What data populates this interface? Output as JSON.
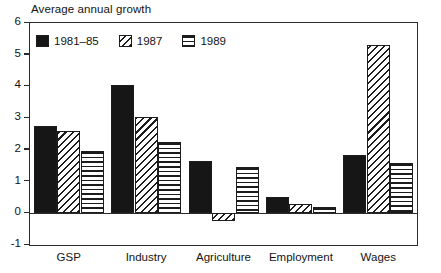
{
  "chart_data": {
    "type": "bar",
    "title": "Average annual growth",
    "xlabel": "",
    "ylabel": "",
    "ylim": [
      -1,
      6
    ],
    "yticks": [
      6,
      5,
      4,
      3,
      2,
      1,
      0,
      -1
    ],
    "ytick_labels": [
      "6",
      "5",
      "4",
      "3",
      "2",
      "1",
      "0",
      "-1"
    ],
    "grid": false,
    "legend_position": "top-left inside plot",
    "categories": [
      "GSP",
      "Industry",
      "Agriculture",
      "Employment",
      "Wages"
    ],
    "series": [
      {
        "name": "1981–85",
        "pattern": "solid-black",
        "values": [
          2.75,
          4.05,
          1.65,
          0.5,
          1.85
        ]
      },
      {
        "name": "1987",
        "pattern": "diagonal-hatch",
        "values": [
          2.6,
          3.05,
          -0.25,
          0.3,
          5.3
        ]
      },
      {
        "name": "1989",
        "pattern": "horizontal-lines",
        "values": [
          1.95,
          2.25,
          1.45,
          0.2,
          1.6
        ]
      }
    ]
  },
  "colors": {
    "axis": "#2b2b2b",
    "ink": "#141414",
    "series_solid": "#161616",
    "background": "#ffffff"
  }
}
